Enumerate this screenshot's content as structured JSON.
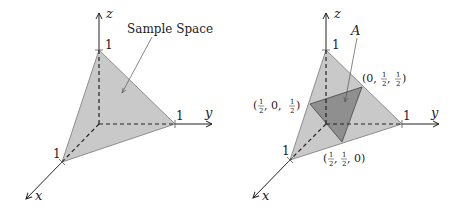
{
  "figure": {
    "colors": {
      "axis": "#222222",
      "simplex_fill": "#c9c9c9",
      "simplex_stroke": "#777777",
      "event_fill": "#8f8f8f",
      "dashed": "#222222",
      "leader": "#555555"
    },
    "left_panel": {
      "axes": {
        "x": "x",
        "y": "y",
        "z": "z"
      },
      "ticks": {
        "x": "1",
        "y": "1",
        "z": "1"
      },
      "annotation": "Sample Space"
    },
    "right_panel": {
      "axes": {
        "x": "x",
        "y": "y",
        "z": "z"
      },
      "ticks": {
        "x": "1",
        "y": "1",
        "z": "1"
      },
      "annotation": "A",
      "points": [
        {
          "label_open": "(",
          "num": "1",
          "den": "2",
          "mid": ", 0, ",
          "num2": "1",
          "den2": "2",
          "close": ")",
          "full": "(1/2, 0, 1/2)"
        },
        {
          "label_open": "(0, ",
          "num": "1",
          "den": "2",
          "mid": ", ",
          "num2": "1",
          "den2": "2",
          "close": ")",
          "full": "(0, 1/2, 1/2)"
        },
        {
          "label_open": "(",
          "num": "1",
          "den": "2",
          "mid": ", ",
          "num2": "1",
          "den2": "2",
          "close": ", 0)",
          "full": "(1/2, 1/2, 0)"
        }
      ]
    }
  }
}
